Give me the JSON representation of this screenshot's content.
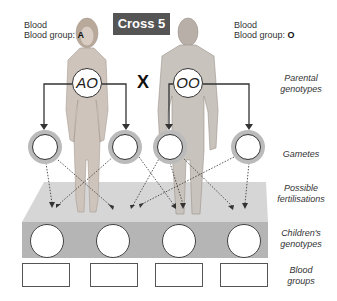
{
  "title": "Cross 5",
  "parents": [
    {
      "label_prefix": "Blood group: ",
      "blood_group": "A",
      "genotype": "AO",
      "figure": "female"
    },
    {
      "label_prefix": "Blood group: ",
      "blood_group": "O",
      "genotype": "OO",
      "figure": "male"
    }
  ],
  "cross_symbol": "X",
  "gametes": [
    "",
    "",
    "",
    ""
  ],
  "children_genotypes": [
    "",
    "",
    "",
    ""
  ],
  "children_blood_groups": [
    "",
    "",
    "",
    ""
  ],
  "row_labels": {
    "parental_genotypes": [
      "Parental",
      "genotypes"
    ],
    "gametes": [
      "Gametes"
    ],
    "possible_fertilisations": [
      "Possible",
      "fertilisations"
    ],
    "childrens_genotypes": [
      "Children's",
      "genotypes"
    ],
    "blood_groups": [
      "Blood",
      "groups"
    ]
  },
  "colors": {
    "title_bg": "#555555",
    "platform_top": "#d4d4d4",
    "platform_front": "#b3b3b3",
    "gamete_ring": "#bbbbbb"
  }
}
